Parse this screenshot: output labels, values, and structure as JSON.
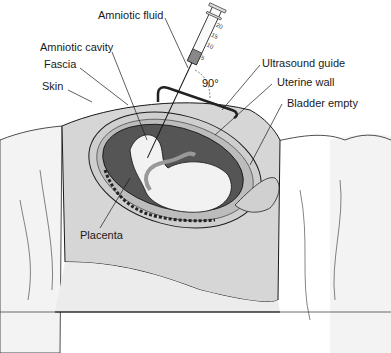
{
  "figure": {
    "labels": {
      "amniotic_fluid": "Amniotic fluid",
      "amniotic_cavity": "Amniotic cavity",
      "fascia": "Fascia",
      "skin": "Skin",
      "ultrasound_guide": "Ultrasound guide",
      "uterine_wall": "Uterine wall",
      "bladder_empty": "Bladder empty",
      "placenta": "Placenta",
      "angle": "90°"
    },
    "syringe_scale": [
      "20",
      "15",
      "10",
      "5"
    ],
    "colors": {
      "skin_fill": "#d6d6d6",
      "sheet_fill": "#efefef",
      "amniotic_fluid_dark": "#555555",
      "fetus_fill": "#f2f2f2",
      "outline": "#1a1a1a"
    }
  }
}
